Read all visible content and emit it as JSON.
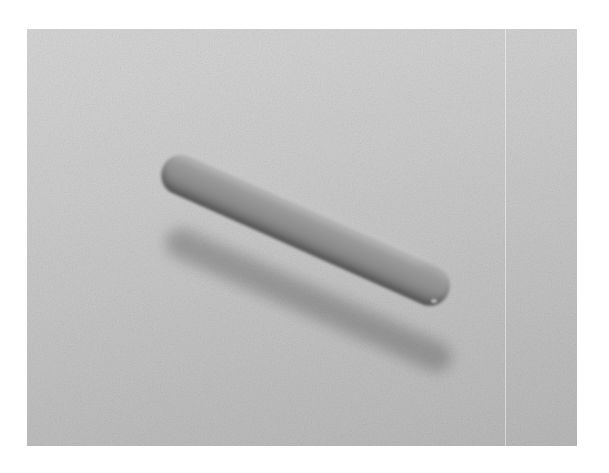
{
  "image": {
    "description": "Grayscale scanning electron micrograph of a single rod-shaped (bacillus) cell lying diagonally on a textured gray substrate",
    "subject": "rod-shaped bacterium",
    "colors": {
      "page_background": "#ffffff",
      "substrate_light": "#d6d6d6",
      "substrate_dark": "#b9b9b9",
      "rod_light": "#a7a7a7",
      "rod_dark": "#6a6a6a"
    },
    "frame": {
      "x": 27,
      "y": 29,
      "width": 550,
      "height": 417
    },
    "rod": {
      "start": [
        163,
        165
      ],
      "end": [
        452,
        290
      ],
      "thickness": 40,
      "angle_deg": 24
    }
  }
}
